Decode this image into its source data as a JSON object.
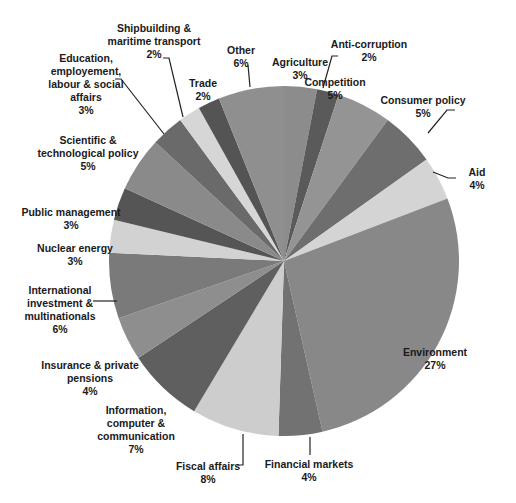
{
  "chart_data": {
    "type": "pie",
    "title": "",
    "start_angle_deg": 0,
    "direction": "clockwise",
    "slices": [
      {
        "label": "Agriculture",
        "value": 3,
        "pct": "3%",
        "color": "#8c8c8c"
      },
      {
        "label": "Anti-corruption",
        "value": 2,
        "pct": "2%",
        "color": "#5a5a5a"
      },
      {
        "label": "Competition",
        "value": 5,
        "pct": "5%",
        "color": "#949494"
      },
      {
        "label": "Consumer policy",
        "value": 5,
        "pct": "5%",
        "color": "#6e6e6e"
      },
      {
        "label": "Aid",
        "value": 4,
        "pct": "4%",
        "color": "#d4d4d4"
      },
      {
        "label": "Environment",
        "value": 27,
        "pct": "27%",
        "color": "#888888"
      },
      {
        "label": "Financial markets",
        "value": 4,
        "pct": "4%",
        "color": "#727272"
      },
      {
        "label": "Fiscal affairs",
        "value": 8,
        "pct": "8%",
        "color": "#cdcdcd"
      },
      {
        "label": "Information, computer & communication",
        "value": 7,
        "pct": "7%",
        "color": "#5f5f5f"
      },
      {
        "label": "Insurance & private pensions",
        "value": 4,
        "pct": "4%",
        "color": "#8e8e8e"
      },
      {
        "label": "International investment & multinationals",
        "value": 6,
        "pct": "6%",
        "color": "#7a7a7a"
      },
      {
        "label": "Nuclear energy",
        "value": 3,
        "pct": "3%",
        "color": "#d2d2d2"
      },
      {
        "label": "Public management",
        "value": 3,
        "pct": "3%",
        "color": "#555555"
      },
      {
        "label": "Scientific & technological policy",
        "value": 5,
        "pct": "5%",
        "color": "#8a8a8a"
      },
      {
        "label": "Education, employement, labour & social affairs",
        "value": 3,
        "pct": "3%",
        "color": "#6a6a6a"
      },
      {
        "label": "Shipbuilding & maritime transport",
        "value": 2,
        "pct": "2%",
        "color": "#d6d6d6"
      },
      {
        "label": "Trade",
        "value": 2,
        "pct": "2%",
        "color": "#545454"
      },
      {
        "label": "Other",
        "value": 6,
        "pct": "6%",
        "color": "#8f8f8f"
      }
    ],
    "legend": "none (data labels with leader lines)"
  },
  "labels": [
    {
      "text": "Agriculture\n3%",
      "x": 300,
      "y": 56,
      "w": 70
    },
    {
      "text": "Anti-corruption\n2%",
      "x": 314,
      "y": 38,
      "w": 110,
      "anchor": "left"
    },
    {
      "text": "Competition\n5%",
      "x": 335,
      "y": 76,
      "w": 70
    },
    {
      "text": "Consumer policy\n5%",
      "x": 423,
      "y": 94,
      "w": 110
    },
    {
      "text": "Aid\n4%",
      "x": 477,
      "y": 166,
      "w": 40
    },
    {
      "text": "Environment\n27%",
      "x": 435,
      "y": 346,
      "w": 100
    },
    {
      "text": "Financial markets\n4%",
      "x": 309,
      "y": 458,
      "w": 110
    },
    {
      "text": "Fiscal affairs\n8%",
      "x": 208,
      "y": 460,
      "w": 100
    },
    {
      "text": "Information,\ncomputer &\ncommunication\n7%",
      "x": 136,
      "y": 404,
      "w": 110
    },
    {
      "text": "Insurance & private\npensions\n4%",
      "x": 90,
      "y": 359,
      "w": 120
    },
    {
      "text": "International\ninvestment &\nmultinationals\n6%",
      "x": 60,
      "y": 284,
      "w": 100
    },
    {
      "text": "Nuclear energy\n3%",
      "x": 75,
      "y": 242,
      "w": 100
    },
    {
      "text": "Public management\n3%",
      "x": 71,
      "y": 206,
      "w": 120
    },
    {
      "text": "Scientific &\ntechnological policy\n5%",
      "x": 88,
      "y": 134,
      "w": 130
    },
    {
      "text": "Education,\nemployement,\nlabour & social\naffairs\n3%",
      "x": 86,
      "y": 52,
      "w": 120
    },
    {
      "text": "Shipbuilding &\nmaritime transport\n2%",
      "x": 154,
      "y": 22,
      "w": 120
    },
    {
      "text": "Trade\n2%",
      "x": 203,
      "y": 77,
      "w": 50
    },
    {
      "text": "Other\n6%",
      "x": 241,
      "y": 44,
      "w": 50
    }
  ],
  "leaders": [
    [
      323,
      88,
      332,
      56,
      338,
      56
    ],
    [
      428,
      133,
      447,
      110,
      455,
      110
    ],
    [
      433,
      172,
      448,
      178,
      456,
      178
    ],
    [
      310,
      437,
      310,
      455
    ],
    [
      243,
      434,
      243,
      465,
      237,
      465
    ],
    [
      117,
      301,
      93,
      301
    ],
    [
      164,
      134,
      121,
      79,
      115,
      79
    ],
    [
      183,
      117,
      169,
      58,
      163,
      58
    ],
    [
      250,
      87,
      248,
      65
    ]
  ]
}
